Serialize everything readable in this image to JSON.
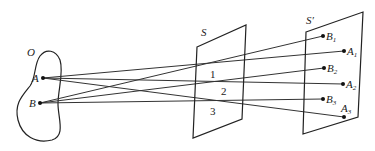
{
  "labels": {
    "object": "O",
    "point_a": "A",
    "point_b": "B",
    "screen_s": "S",
    "screen_s_prime": "S′",
    "region_1": "1",
    "region_2": "2",
    "region_3": "3",
    "b1": {
      "base": "B",
      "sub": "1"
    },
    "a1": {
      "base": "A",
      "sub": "1"
    },
    "b2": {
      "base": "B",
      "sub": "2"
    },
    "a2": {
      "base": "A",
      "sub": "2"
    },
    "b3": {
      "base": "B",
      "sub": "3"
    },
    "a3": {
      "base": "A",
      "sub": "3"
    }
  },
  "colors": {
    "line": "#222222",
    "background": "#ffffff"
  }
}
